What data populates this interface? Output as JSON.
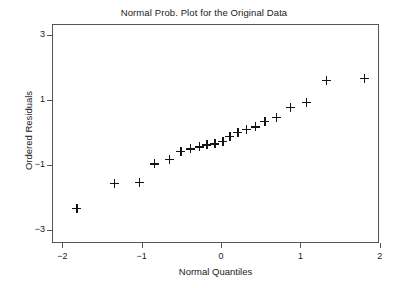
{
  "chart_data": {
    "type": "scatter",
    "title": "Normal Prob. Plot for the Original Data",
    "xlabel": "Normal Quantiles",
    "ylabel": "Ordered Residuals",
    "xlim": [
      -2.13,
      1.99
    ],
    "ylim": [
      -3.41,
      3.35
    ],
    "grid": false,
    "legend": null,
    "marker": "plus",
    "marker_color": "#141414",
    "xticks": [
      -2,
      -1,
      0,
      1,
      2
    ],
    "xtick_labels": [
      "−2",
      "−1",
      "0",
      "1",
      "2"
    ],
    "yticks": [
      3,
      1,
      -1,
      -3
    ],
    "ytick_labels": [
      "3",
      "1",
      "−1",
      "−3"
    ],
    "n_points": 20,
    "x": [
      -1.83,
      -1.36,
      -1.04,
      -0.85,
      -0.66,
      -0.52,
      -0.4,
      -0.29,
      -0.19,
      -0.09,
      0.01,
      0.1,
      0.2,
      0.31,
      0.42,
      0.54,
      0.68,
      0.86,
      1.06,
      1.31,
      1.79
    ],
    "y": [
      -2.32,
      -1.53,
      -1.5,
      -0.94,
      -0.77,
      -0.56,
      -0.47,
      -0.41,
      -0.35,
      -0.32,
      -0.24,
      -0.09,
      0.03,
      0.12,
      0.21,
      0.38,
      0.5,
      0.8,
      0.96,
      1.65,
      1.71,
      2.5
    ],
    "points": [
      {
        "x": -1.83,
        "y": -2.32
      },
      {
        "x": -1.36,
        "y": -1.53
      },
      {
        "x": -1.04,
        "y": -1.5
      },
      {
        "x": -0.85,
        "y": -0.94
      },
      {
        "x": -0.66,
        "y": -0.79
      },
      {
        "x": -0.52,
        "y": -0.56
      },
      {
        "x": -0.4,
        "y": -0.47
      },
      {
        "x": -0.29,
        "y": -0.41
      },
      {
        "x": -0.19,
        "y": -0.35
      },
      {
        "x": -0.09,
        "y": -0.32
      },
      {
        "x": 0.01,
        "y": -0.24
      },
      {
        "x": 0.1,
        "y": -0.09
      },
      {
        "x": 0.2,
        "y": 0.03
      },
      {
        "x": 0.31,
        "y": 0.12
      },
      {
        "x": 0.42,
        "y": 0.21
      },
      {
        "x": 0.54,
        "y": 0.38
      },
      {
        "x": 0.68,
        "y": 0.5
      },
      {
        "x": 0.86,
        "y": 0.8
      },
      {
        "x": 1.06,
        "y": 0.96
      },
      {
        "x": 1.31,
        "y": 1.65
      },
      {
        "x": 1.79,
        "y": 1.71
      }
    ]
  }
}
